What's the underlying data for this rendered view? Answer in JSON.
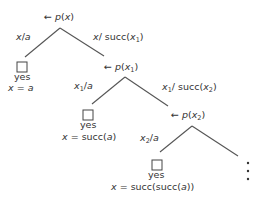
{
  "diagram": {
    "type": "sld-resolution-tree",
    "nodes": [
      {
        "id": "n0",
        "goal_prefix": "← ",
        "pred": "p",
        "arg": "x",
        "arg_sub": ""
      },
      {
        "id": "n1",
        "goal_prefix": "← ",
        "pred": "p",
        "arg": "x",
        "arg_sub": "1"
      },
      {
        "id": "n2",
        "goal_prefix": "← ",
        "pred": "p",
        "arg": "x",
        "arg_sub": "2"
      }
    ],
    "edges": [
      {
        "from": "n0",
        "to": "leaf0",
        "var": "x",
        "var_sub": "",
        "sep": "/",
        "value": "a"
      },
      {
        "from": "n0",
        "to": "n1",
        "var": "x",
        "var_sub": "",
        "sep": "/ ",
        "value_fn": "succ",
        "value_arg": "x",
        "value_arg_sub": "1"
      },
      {
        "from": "n1",
        "to": "leaf1",
        "var": "x",
        "var_sub": "1",
        "sep": "/",
        "value": "a"
      },
      {
        "from": "n1",
        "to": "n2",
        "var": "x",
        "var_sub": "1",
        "sep": "/ ",
        "value_fn": "succ",
        "value_arg": "x",
        "value_arg_sub": "2"
      },
      {
        "from": "n2",
        "to": "leaf2",
        "var": "x",
        "var_sub": "2",
        "sep": "/",
        "value": "a"
      },
      {
        "from": "n2",
        "to": "continuation",
        "label": ""
      }
    ],
    "leaves": [
      {
        "id": "leaf0",
        "result": "yes",
        "answer_var": "x",
        "answer_eq": " = ",
        "answer_val": "a",
        "answer_pre": "",
        "answer_post": ""
      },
      {
        "id": "leaf1",
        "result": "yes",
        "answer_var": "x",
        "answer_eq": " = ",
        "answer_pre": "succ(",
        "answer_val": "a",
        "answer_post": ")"
      },
      {
        "id": "leaf2",
        "result": "yes",
        "answer_var": "x",
        "answer_eq": " = ",
        "answer_pre": "succ(succ(",
        "answer_val": "a",
        "answer_post": "))"
      }
    ],
    "continuation": "vertical-ellipsis",
    "colors": {
      "ink": "#333333",
      "edge": "#555555"
    }
  }
}
